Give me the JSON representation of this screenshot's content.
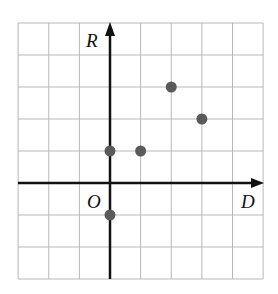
{
  "chart_data": {
    "type": "scatter",
    "title": "",
    "xlabel": "D",
    "ylabel": "R",
    "origin_label": "O",
    "grid": true,
    "xlim": [
      -3,
      5
    ],
    "ylim": [
      -3,
      5
    ],
    "points": [
      {
        "x": 0,
        "y": 1
      },
      {
        "x": 1,
        "y": 1
      },
      {
        "x": 2,
        "y": 3
      },
      {
        "x": 3,
        "y": 2
      },
      {
        "x": 0,
        "y": -1
      }
    ],
    "colors": {
      "grid": "#b8b8b8",
      "axis": "#111111",
      "point": "#5a5a5a"
    }
  }
}
